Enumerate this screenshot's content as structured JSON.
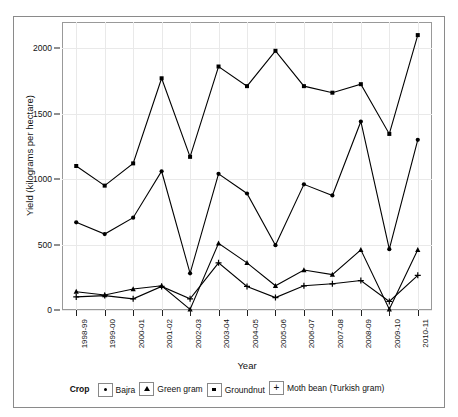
{
  "top_strip": {
    "text": "—  ··  ——  ·  ———  ····  ——————  ··  —"
  },
  "chart_data": {
    "type": "line",
    "title": "",
    "xlabel": "Year",
    "ylabel": "Yield (kilograms per hectare)",
    "ylim": [
      0,
      2200
    ],
    "yticks": [
      0,
      500,
      1000,
      1500,
      2000
    ],
    "ytick_labels": [
      "0",
      "500",
      "1000",
      "1500",
      "2000"
    ],
    "grid": true,
    "legend_position": "bottom",
    "legend_title": "Crop",
    "categories": [
      "1998-99",
      "1999-00",
      "2000-01",
      "2001-02",
      "2002-03",
      "2003-04",
      "2004-05",
      "2005-06",
      "2006-07",
      "2007-08",
      "2008-09",
      "2009-10",
      "2010-11"
    ],
    "series": [
      {
        "name": "Bajra",
        "marker": "circle",
        "color": "#000000",
        "values": [
          670,
          580,
          705,
          1060,
          280,
          1040,
          890,
          495,
          960,
          875,
          1440,
          465,
          1300
        ]
      },
      {
        "name": "Green gram",
        "marker": "triangle",
        "color": "#000000",
        "values": [
          140,
          115,
          160,
          185,
          5,
          510,
          360,
          185,
          305,
          270,
          460,
          5,
          460
        ]
      },
      {
        "name": "Groundnut",
        "marker": "square",
        "color": "#000000",
        "values": [
          1100,
          950,
          1120,
          1770,
          1170,
          1860,
          1710,
          1980,
          1710,
          1660,
          1725,
          1345,
          2100
        ]
      },
      {
        "name": "Moth bean (Turkish gram)",
        "marker": "plus",
        "color": "#000000",
        "values": [
          100,
          110,
          85,
          180,
          85,
          360,
          180,
          95,
          185,
          200,
          225,
          65,
          265
        ]
      }
    ]
  }
}
